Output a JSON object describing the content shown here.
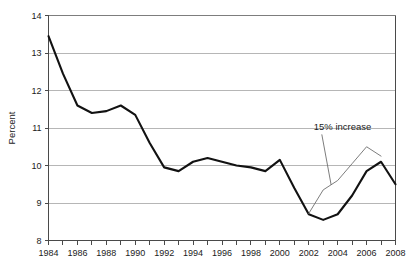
{
  "chart_data": {
    "type": "line",
    "title": "",
    "subtitle": "",
    "xlabel": "",
    "ylabel": "Percent",
    "xlim": [
      1984,
      2008
    ],
    "ylim": [
      8,
      14
    ],
    "grid": true,
    "grid_axis": "y",
    "legend": "none",
    "y_ticks": [
      8,
      9,
      10,
      11,
      12,
      13,
      14
    ],
    "y_tick_labels": [
      "8",
      "9",
      "10",
      "11",
      "12",
      "13",
      "14"
    ],
    "x_ticks": [
      1984,
      1985,
      1986,
      1987,
      1988,
      1989,
      1990,
      1991,
      1992,
      1993,
      1994,
      1995,
      1996,
      1997,
      1998,
      1999,
      2000,
      2001,
      2002,
      2003,
      2004,
      2005,
      2006,
      2007,
      2008
    ],
    "x_tick_labels_shown": [
      "1984",
      "1986",
      "1988",
      "1990",
      "1992",
      "1994",
      "1996",
      "1998",
      "2000",
      "2002",
      "2004",
      "2006",
      "2008"
    ],
    "x_label_interval": 2,
    "series": [
      {
        "name": "Percent",
        "style": "solid-thick",
        "color": "#121212",
        "x": [
          1984,
          1985,
          1986,
          1987,
          1988,
          1989,
          1990,
          1991,
          1992,
          1993,
          1994,
          1995,
          1996,
          1997,
          1998,
          1999,
          2000,
          2001,
          2002,
          2003,
          2004,
          2005,
          2006,
          2007,
          2008
        ],
        "values": [
          13.45,
          12.45,
          11.6,
          11.4,
          11.45,
          11.6,
          11.35,
          10.6,
          9.95,
          9.85,
          10.1,
          10.2,
          10.1,
          10.0,
          9.95,
          9.85,
          10.15,
          9.4,
          8.7,
          8.55,
          8.7,
          9.2,
          9.85,
          10.1,
          9.5
        ]
      },
      {
        "name": "15% increase projection",
        "style": "solid-thin",
        "color": "#6e6e6e",
        "x": [
          2002,
          2003,
          2004,
          2005,
          2006,
          2007
        ],
        "values": [
          8.72,
          9.35,
          9.6,
          10.05,
          10.5,
          10.25
        ]
      }
    ],
    "annotations": [
      {
        "text": "15% increase",
        "x": 2002.35,
        "y": 10.95,
        "leader_to_x": 2003.55,
        "leader_to_y": 9.48
      }
    ]
  },
  "axes": {
    "y_axis_title": "Percent"
  }
}
